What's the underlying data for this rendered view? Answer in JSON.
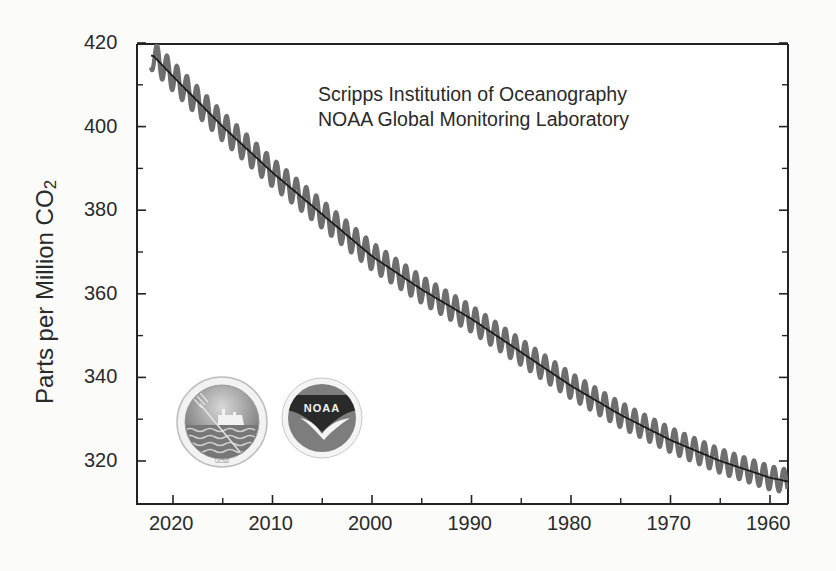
{
  "chart_data": {
    "type": "line",
    "title": "",
    "credits": [
      "Scripps Institution of Oceanography",
      "NOAA Global Monitoring Laboratory"
    ],
    "xlabel": "",
    "ylabel": "Parts per Million CO2",
    "ylabel_main": "Parts per Million CO",
    "ylabel_sub": "2",
    "x_reversed": true,
    "xlim": [
      2023.6,
      1958.2
    ],
    "ylim": [
      310.5,
      420.5
    ],
    "x_ticks": [
      2020,
      2010,
      2000,
      1990,
      1980,
      1970,
      1960
    ],
    "x_minor_ticks": [
      2015,
      2005,
      1995,
      1985,
      1975,
      1965
    ],
    "y_ticks": [
      320,
      340,
      360,
      380,
      400,
      420
    ],
    "y_minor_ticks": [
      330,
      350,
      370,
      390,
      410
    ],
    "grid": false,
    "legend": null,
    "series": [
      {
        "name": "Monthly mean CO2 (seasonal cycle)",
        "style": "thick gray oscillating line",
        "seasonal_amplitude_ppm": 3.5
      },
      {
        "name": "Seasonally adjusted trend",
        "style": "thin black line",
        "x": [
          2022,
          2020,
          2015,
          2010,
          2005,
          2000,
          1995,
          1990,
          1985,
          1980,
          1975,
          1970,
          1965,
          1960,
          1958
        ],
        "y": [
          417,
          412,
          400,
          389,
          379,
          369,
          361,
          354,
          346,
          338,
          331,
          325,
          320,
          316,
          315
        ]
      }
    ],
    "logos": [
      "Scripps Institution of Oceanography seal",
      "NOAA logo"
    ]
  },
  "axes": {
    "y_tick_labels": [
      "420",
      "400",
      "380",
      "360",
      "340",
      "320"
    ],
    "x_tick_labels": [
      "2020",
      "2010",
      "2000",
      "1990",
      "1980",
      "1970",
      "1960"
    ]
  },
  "logos": {
    "noaa_text": "NOAA"
  }
}
